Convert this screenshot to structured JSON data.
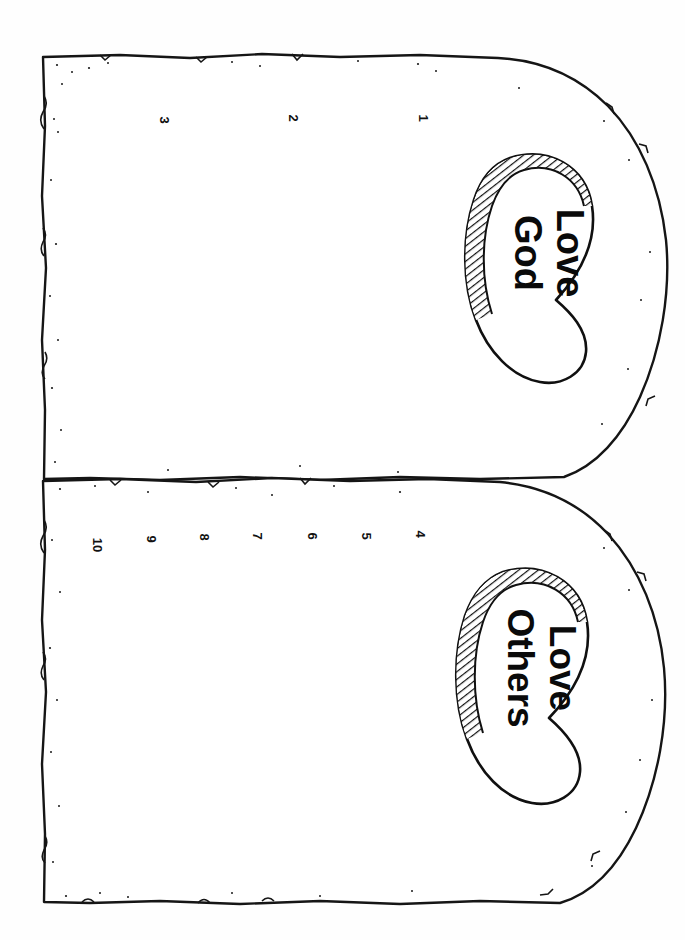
{
  "page": {
    "orientation": "rotated-90-clockwise",
    "background_color": "#fefefe",
    "ink_color": "#111111",
    "paper_width": 685,
    "paper_height": 940
  },
  "artwork": {
    "name": "two-stone-tablets",
    "style": "hand-drawn black line art, speckled rough edges, no fill",
    "tablets": [
      {
        "id": "tablet-one",
        "position": "upper",
        "numbers": [
          "1",
          "2",
          "3"
        ],
        "heart": {
          "id": "heart-love-god",
          "line1": "Love",
          "line2": "God",
          "shading": "hatched-band"
        }
      },
      {
        "id": "tablet-two",
        "position": "lower",
        "numbers": [
          "4",
          "5",
          "6",
          "7",
          "8",
          "9",
          "10"
        ],
        "heart": {
          "id": "heart-love-others",
          "line1": "Love",
          "line2": "Others",
          "shading": "hatched-band"
        }
      }
    ]
  },
  "numbers_upper": [
    {
      "label": "1",
      "x": 422,
      "y": 118
    },
    {
      "label": "2",
      "x": 292,
      "y": 118
    },
    {
      "label": "3",
      "x": 163,
      "y": 120
    }
  ],
  "numbers_lower": [
    {
      "label": "4",
      "x": 419,
      "y": 534
    },
    {
      "label": "5",
      "x": 365,
      "y": 536
    },
    {
      "label": "6",
      "x": 311,
      "y": 536
    },
    {
      "label": "7",
      "x": 256,
      "y": 536
    },
    {
      "label": "8",
      "x": 203,
      "y": 537
    },
    {
      "label": "9",
      "x": 150,
      "y": 539
    },
    {
      "label": "10",
      "x": 96,
      "y": 542
    }
  ],
  "hearts": {
    "love_god": {
      "line1": "Love",
      "line2": "God",
      "center_x": 540,
      "center_y": 253
    },
    "love_others": {
      "line1": "Love",
      "line2": "Others",
      "center_x": 534,
      "center_y": 668
    }
  }
}
